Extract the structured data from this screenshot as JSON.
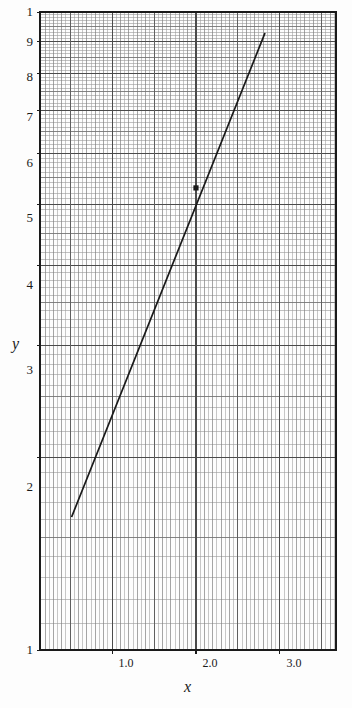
{
  "figure": {
    "background_color": "#fdfdfd",
    "plot_area": {
      "left": 40,
      "top": 12,
      "right": 336,
      "bottom": 650
    },
    "ink_color": "#1a1a1a",
    "grid_major_color": "#4a4a4a",
    "grid_minor_color": "#9a9a9a"
  },
  "chart_data": {
    "type": "line",
    "title": "",
    "xlabel": "x",
    "ylabel": "y",
    "xscale": "linear",
    "yscale": "log",
    "xlim": [
      0.14,
      3.67
    ],
    "ylim": [
      1,
      10
    ],
    "grid": true,
    "grid_style": "semi-log graph paper (linear x, logarithmic y)",
    "legend": "none",
    "xticks": [
      1.0,
      2.0,
      3.0
    ],
    "xtick_labels": [
      "1.0",
      "2.0",
      "3.0"
    ],
    "yticks": [
      1,
      2,
      3,
      4,
      5,
      6,
      7,
      8,
      9,
      10
    ],
    "ytick_labels": [
      "1",
      "2",
      "3",
      "4",
      "5",
      "6",
      "7",
      "8",
      "9",
      "1"
    ],
    "series": [
      {
        "name": "fitted line",
        "style": "solid",
        "color": "#1a1a1a",
        "x": [
          0.52,
          2.82
        ],
        "y": [
          1.62,
          9.25
        ]
      }
    ],
    "annotations": [
      {
        "name": "marked-point",
        "marker": "filled-square",
        "x": 2.0,
        "y": 5.3
      }
    ]
  },
  "labels": {
    "y_axis": "y",
    "x_axis": "x",
    "y_top": "1",
    "y_9": "9",
    "y_8": "8",
    "y_7": "7",
    "y_6": "6",
    "y_5": "5",
    "y_4": "4",
    "y_3": "3",
    "y_2": "2",
    "y_bottom": "1",
    "x_1": "1.0",
    "x_2": "2.0",
    "x_3": "3.0"
  }
}
